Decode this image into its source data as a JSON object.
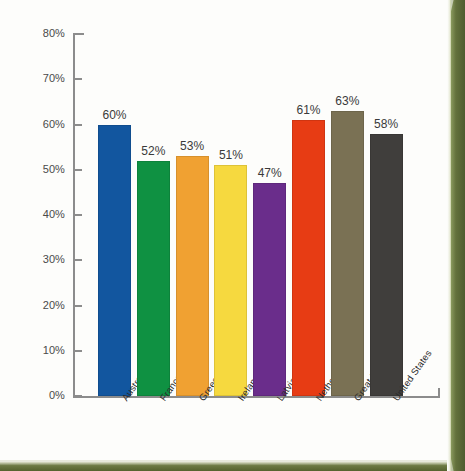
{
  "chart_data": {
    "type": "bar",
    "title": "",
    "subtitle": "",
    "xlabel": "",
    "ylabel": "",
    "ylim": [
      0,
      80
    ],
    "y_tick_labels": [
      "0%",
      "10%",
      "20%",
      "30%",
      "40%",
      "50%",
      "60%",
      "70%",
      "80%"
    ],
    "y_tick_values": [
      0,
      10,
      20,
      30,
      40,
      50,
      60,
      70,
      80
    ],
    "grid": false,
    "legend": "none",
    "value_label_suffix": "%",
    "categories": [
      "Australia",
      "France",
      "Greece",
      "Ireland",
      "Latvia",
      "Netherlands",
      "Great Britain",
      "United States"
    ],
    "values": [
      60,
      52,
      53,
      51,
      47,
      61,
      63,
      58
    ],
    "value_labels": [
      "60%",
      "52%",
      "53%",
      "51%",
      "47%",
      "61%",
      "63%",
      "58%"
    ],
    "bar_colors": [
      "#12569f",
      "#0f9142",
      "#f0a132",
      "#f6d93f",
      "#6a2d8b",
      "#e73c14",
      "#7a7154",
      "#403e3c"
    ],
    "bars": [
      {
        "category": "Australia",
        "value": 60,
        "label": "60%",
        "color": "#12569f"
      },
      {
        "category": "France",
        "value": 52,
        "label": "52%",
        "color": "#0f9142"
      },
      {
        "category": "Greece",
        "value": 53,
        "label": "53%",
        "color": "#f0a132"
      },
      {
        "category": "Ireland",
        "value": 51,
        "label": "51%",
        "color": "#f6d93f"
      },
      {
        "category": "Latvia",
        "value": 47,
        "label": "47%",
        "color": "#6a2d8b"
      },
      {
        "category": "Netherlands",
        "value": 61,
        "label": "61%",
        "color": "#e73c14"
      },
      {
        "category": "Great Britain",
        "value": 63,
        "label": "63%",
        "color": "#7a7154"
      },
      {
        "category": "United States",
        "value": 58,
        "label": "58%",
        "color": "#403e3c"
      }
    ]
  },
  "page": {
    "background_color": "#fdfdfb",
    "edge_color": "#5d6b3a",
    "axis_color": "#8c8c8c",
    "tick_text_color": "#4a4a4a",
    "value_text_color": "#3a3a3a"
  }
}
